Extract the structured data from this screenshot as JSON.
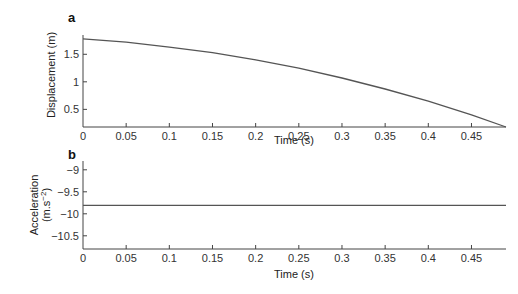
{
  "chart_data": [
    {
      "type": "line",
      "panel": "a",
      "title": "",
      "xlabel": "Time (s)",
      "ylabel": "Displacement (m)",
      "xlim": [
        0,
        0.49
      ],
      "ylim": [
        0.18,
        1.85
      ],
      "xticks": [
        0,
        0.05,
        0.1,
        0.15,
        0.2,
        0.25,
        0.3,
        0.35,
        0.4,
        0.45
      ],
      "xtick_labels": [
        "0",
        "0.05",
        "0.1",
        "0.15",
        "0.2",
        "0.25",
        "0.3",
        "0.35",
        "0.4",
        "0.45"
      ],
      "yticks": [
        0.5,
        1,
        1.5
      ],
      "ytick_labels": [
        "0.5",
        "1",
        "1.5"
      ],
      "grid": false,
      "series": [
        {
          "name": "displacement",
          "x": [
            0,
            0.05,
            0.1,
            0.15,
            0.2,
            0.25,
            0.3,
            0.35,
            0.4,
            0.45,
            0.49
          ],
          "values": [
            1.78,
            1.72,
            1.63,
            1.53,
            1.4,
            1.25,
            1.07,
            0.87,
            0.65,
            0.4,
            0.18
          ]
        }
      ]
    },
    {
      "type": "line",
      "panel": "b",
      "title": "",
      "xlabel": "Time (s)",
      "ylabel": "Acceleration (m.s⁻²)",
      "xlim": [
        0,
        0.49
      ],
      "ylim": [
        -10.8,
        -8.8
      ],
      "xticks": [
        0,
        0.05,
        0.1,
        0.15,
        0.2,
        0.25,
        0.3,
        0.35,
        0.4,
        0.45
      ],
      "xtick_labels": [
        "0",
        "0.05",
        "0.1",
        "0.15",
        "0.2",
        "0.25",
        "0.3",
        "0.35",
        "0.4",
        "0.45"
      ],
      "yticks": [
        -9,
        -9.5,
        -10,
        -10.5
      ],
      "ytick_labels": [
        "−9",
        "−9.5",
        "−10",
        "−10.5"
      ],
      "grid": false,
      "series": [
        {
          "name": "acceleration",
          "x": [
            0,
            0.49
          ],
          "values": [
            -9.81,
            -9.81
          ]
        }
      ]
    }
  ],
  "labels": {
    "panel_a": "a",
    "panel_b": "b",
    "a_xlabel": "Time (s)",
    "a_ylabel": "Displacement (m)",
    "b_xlabel": "Time (s)",
    "b_ylabel_line1": "Acceleration",
    "b_ylabel_line2": "(m.s",
    "b_ylabel_sup": "−2",
    "b_ylabel_close": ")"
  },
  "colors": {
    "line": "#555555",
    "axis": "#444444"
  }
}
